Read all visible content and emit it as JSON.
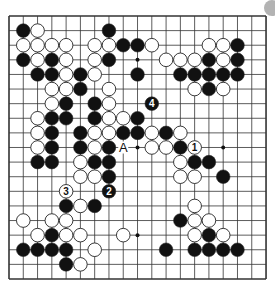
{
  "board": {
    "size": 19,
    "origin_x": 9,
    "origin_y": 16,
    "step_x": 14.28,
    "step_y": 14.61,
    "line_color": "#333333",
    "edge_width": 1.6,
    "stone_black": "#111111",
    "stone_white": "#ffffff",
    "star_points": [
      [
        3,
        3
      ],
      [
        9,
        3
      ],
      [
        15,
        3
      ],
      [
        3,
        9
      ],
      [
        9,
        9
      ],
      [
        15,
        9
      ],
      [
        3,
        15
      ],
      [
        9,
        15
      ],
      [
        15,
        15
      ]
    ],
    "stones": [
      {
        "c": 1,
        "r": 1,
        "color": "B"
      },
      {
        "c": 2,
        "r": 1,
        "color": "W"
      },
      {
        "c": 7,
        "r": 1,
        "color": "B"
      },
      {
        "c": 1,
        "r": 2,
        "color": "W"
      },
      {
        "c": 2,
        "r": 2,
        "color": "W"
      },
      {
        "c": 3,
        "r": 2,
        "color": "W"
      },
      {
        "c": 4,
        "r": 2,
        "color": "W"
      },
      {
        "c": 6,
        "r": 2,
        "color": "W"
      },
      {
        "c": 7,
        "r": 2,
        "color": "W"
      },
      {
        "c": 8,
        "r": 2,
        "color": "B"
      },
      {
        "c": 9,
        "r": 2,
        "color": "B"
      },
      {
        "c": 10,
        "r": 2,
        "color": "W"
      },
      {
        "c": 14,
        "r": 2,
        "color": "W"
      },
      {
        "c": 15,
        "r": 2,
        "color": "W"
      },
      {
        "c": 16,
        "r": 2,
        "color": "B"
      },
      {
        "c": 1,
        "r": 3,
        "color": "B"
      },
      {
        "c": 2,
        "r": 3,
        "color": "W"
      },
      {
        "c": 3,
        "r": 3,
        "color": "B"
      },
      {
        "c": 4,
        "r": 3,
        "color": "W"
      },
      {
        "c": 6,
        "r": 3,
        "color": "W"
      },
      {
        "c": 7,
        "r": 3,
        "color": "B"
      },
      {
        "c": 11,
        "r": 3,
        "color": "W"
      },
      {
        "c": 12,
        "r": 3,
        "color": "W"
      },
      {
        "c": 13,
        "r": 3,
        "color": "W"
      },
      {
        "c": 14,
        "r": 3,
        "color": "B"
      },
      {
        "c": 15,
        "r": 3,
        "color": "W"
      },
      {
        "c": 16,
        "r": 3,
        "color": "B"
      },
      {
        "c": 2,
        "r": 4,
        "color": "B"
      },
      {
        "c": 3,
        "r": 4,
        "color": "B"
      },
      {
        "c": 4,
        "r": 4,
        "color": "W"
      },
      {
        "c": 5,
        "r": 4,
        "color": "B"
      },
      {
        "c": 6,
        "r": 4,
        "color": "W"
      },
      {
        "c": 9,
        "r": 4,
        "color": "B"
      },
      {
        "c": 12,
        "r": 4,
        "color": "B"
      },
      {
        "c": 13,
        "r": 4,
        "color": "B"
      },
      {
        "c": 14,
        "r": 4,
        "color": "B"
      },
      {
        "c": 15,
        "r": 4,
        "color": "B"
      },
      {
        "c": 16,
        "r": 4,
        "color": "B"
      },
      {
        "c": 3,
        "r": 5,
        "color": "W"
      },
      {
        "c": 4,
        "r": 5,
        "color": "W"
      },
      {
        "c": 5,
        "r": 5,
        "color": "B"
      },
      {
        "c": 7,
        "r": 5,
        "color": "W"
      },
      {
        "c": 13,
        "r": 5,
        "color": "W"
      },
      {
        "c": 14,
        "r": 5,
        "color": "B"
      },
      {
        "c": 15,
        "r": 5,
        "color": "W"
      },
      {
        "c": 3,
        "r": 6,
        "color": "W"
      },
      {
        "c": 4,
        "r": 6,
        "color": "B"
      },
      {
        "c": 6,
        "r": 6,
        "color": "B"
      },
      {
        "c": 7,
        "r": 6,
        "color": "W"
      },
      {
        "c": 10,
        "r": 6,
        "color": "B",
        "label": "4"
      },
      {
        "c": 2,
        "r": 7,
        "color": "W"
      },
      {
        "c": 3,
        "r": 7,
        "color": "B"
      },
      {
        "c": 4,
        "r": 7,
        "color": "B"
      },
      {
        "c": 6,
        "r": 7,
        "color": "B"
      },
      {
        "c": 7,
        "r": 7,
        "color": "W"
      },
      {
        "c": 8,
        "r": 7,
        "color": "W"
      },
      {
        "c": 9,
        "r": 7,
        "color": "B"
      },
      {
        "c": 2,
        "r": 8,
        "color": "W"
      },
      {
        "c": 3,
        "r": 8,
        "color": "B"
      },
      {
        "c": 5,
        "r": 8,
        "color": "B"
      },
      {
        "c": 6,
        "r": 8,
        "color": "W"
      },
      {
        "c": 7,
        "r": 8,
        "color": "W"
      },
      {
        "c": 8,
        "r": 8,
        "color": "B"
      },
      {
        "c": 9,
        "r": 8,
        "color": "B"
      },
      {
        "c": 10,
        "r": 8,
        "color": "W"
      },
      {
        "c": 11,
        "r": 8,
        "color": "B"
      },
      {
        "c": 12,
        "r": 8,
        "color": "W"
      },
      {
        "c": 2,
        "r": 9,
        "color": "W"
      },
      {
        "c": 3,
        "r": 9,
        "color": "B"
      },
      {
        "c": 5,
        "r": 9,
        "color": "B"
      },
      {
        "c": 6,
        "r": 9,
        "color": "W"
      },
      {
        "c": 7,
        "r": 9,
        "color": "B"
      },
      {
        "c": 10,
        "r": 9,
        "color": "W"
      },
      {
        "c": 11,
        "r": 9,
        "color": "W"
      },
      {
        "c": 12,
        "r": 9,
        "color": "B"
      },
      {
        "c": 13,
        "r": 9,
        "color": "W",
        "label": "1"
      },
      {
        "c": 2,
        "r": 10,
        "color": "B"
      },
      {
        "c": 3,
        "r": 10,
        "color": "B"
      },
      {
        "c": 5,
        "r": 10,
        "color": "W"
      },
      {
        "c": 6,
        "r": 10,
        "color": "B"
      },
      {
        "c": 7,
        "r": 10,
        "color": "B"
      },
      {
        "c": 12,
        "r": 10,
        "color": "W"
      },
      {
        "c": 13,
        "r": 10,
        "color": "B"
      },
      {
        "c": 14,
        "r": 10,
        "color": "B"
      },
      {
        "c": 5,
        "r": 11,
        "color": "W"
      },
      {
        "c": 6,
        "r": 11,
        "color": "W"
      },
      {
        "c": 7,
        "r": 11,
        "color": "B"
      },
      {
        "c": 12,
        "r": 11,
        "color": "W"
      },
      {
        "c": 13,
        "r": 11,
        "color": "W"
      },
      {
        "c": 15,
        "r": 11,
        "color": "B"
      },
      {
        "c": 4,
        "r": 12,
        "color": "W",
        "label": "3"
      },
      {
        "c": 7,
        "r": 12,
        "color": "B",
        "label": "2"
      },
      {
        "c": 4,
        "r": 13,
        "color": "B"
      },
      {
        "c": 5,
        "r": 13,
        "color": "W"
      },
      {
        "c": 6,
        "r": 13,
        "color": "B"
      },
      {
        "c": 13,
        "r": 13,
        "color": "W"
      },
      {
        "c": 1,
        "r": 14,
        "color": "W"
      },
      {
        "c": 3,
        "r": 14,
        "color": "W"
      },
      {
        "c": 4,
        "r": 14,
        "color": "W"
      },
      {
        "c": 12,
        "r": 14,
        "color": "B"
      },
      {
        "c": 13,
        "r": 14,
        "color": "W"
      },
      {
        "c": 14,
        "r": 14,
        "color": "W"
      },
      {
        "c": 2,
        "r": 15,
        "color": "W"
      },
      {
        "c": 3,
        "r": 15,
        "color": "B"
      },
      {
        "c": 4,
        "r": 15,
        "color": "W"
      },
      {
        "c": 5,
        "r": 15,
        "color": "W"
      },
      {
        "c": 8,
        "r": 15,
        "color": "W"
      },
      {
        "c": 13,
        "r": 15,
        "color": "W"
      },
      {
        "c": 14,
        "r": 15,
        "color": "B"
      },
      {
        "c": 15,
        "r": 15,
        "color": "W"
      },
      {
        "c": 1,
        "r": 16,
        "color": "B"
      },
      {
        "c": 2,
        "r": 16,
        "color": "B"
      },
      {
        "c": 3,
        "r": 16,
        "color": "B"
      },
      {
        "c": 4,
        "r": 16,
        "color": "B"
      },
      {
        "c": 6,
        "r": 16,
        "color": "W"
      },
      {
        "c": 11,
        "r": 16,
        "color": "B"
      },
      {
        "c": 13,
        "r": 16,
        "color": "B"
      },
      {
        "c": 14,
        "r": 16,
        "color": "B"
      },
      {
        "c": 15,
        "r": 16,
        "color": "B"
      },
      {
        "c": 16,
        "r": 16,
        "color": "B"
      },
      {
        "c": 4,
        "r": 17,
        "color": "B"
      },
      {
        "c": 5,
        "r": 17,
        "color": "W"
      }
    ],
    "markers": [
      {
        "c": 8,
        "r": 9,
        "text": "A"
      }
    ]
  },
  "corner_indicator": {
    "color": "#b3b3b3"
  }
}
